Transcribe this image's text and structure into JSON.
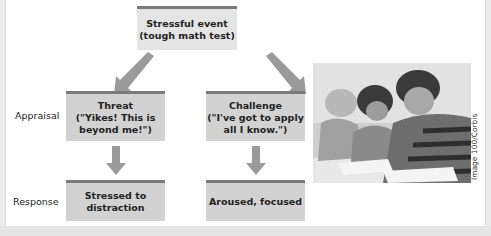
{
  "diagram": {
    "top_box": {
      "label": "Stressful event\n(tough math test)"
    },
    "row_labels": {
      "appraisal": "Appraisal",
      "response": "Response"
    },
    "appraisal": [
      {
        "label": "Threat\n(\"Yikes! This is\nbeyond me!\")"
      },
      {
        "label": "Challenge\n(\"I've got to apply\nall I know.\")"
      }
    ],
    "response": [
      {
        "label": "Stressed to\ndistraction"
      },
      {
        "label": "Aroused, focused"
      }
    ],
    "colors": {
      "box_fill": "#d2d2d2",
      "box_top_bar": "#7a7a7a",
      "arrow": "#9a9a9a"
    }
  },
  "photo": {
    "description": "students-taking-test-photo",
    "credit": "Image 100/Corbis"
  }
}
